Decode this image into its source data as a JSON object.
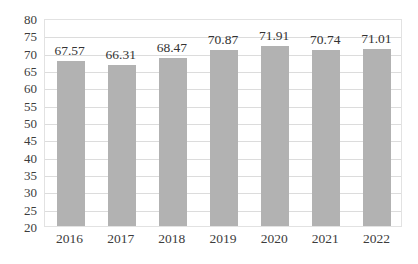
{
  "chart_data": {
    "type": "bar",
    "title": "",
    "subtitle": "",
    "xlabel": "",
    "ylabel": "",
    "categories": [
      "2016",
      "2017",
      "2018",
      "2019",
      "2020",
      "2021",
      "2022"
    ],
    "values": [
      67.57,
      66.31,
      68.47,
      70.87,
      71.91,
      70.74,
      71.01
    ],
    "data_labels": [
      "67.57",
      "66.31",
      "68.47",
      "70.87",
      "71.91",
      "70.74",
      "71.01"
    ],
    "series": [
      {
        "name": "",
        "values": [
          67.57,
          66.31,
          68.47,
          70.87,
          71.91,
          70.74,
          71.01
        ],
        "color": "#B2B2B2"
      }
    ],
    "ylim": [
      20,
      80
    ],
    "ytick_step": 5,
    "ytick_labels": [
      "80",
      "75",
      "70",
      "65",
      "60",
      "55",
      "50",
      "45",
      "40",
      "35",
      "30",
      "25",
      "20"
    ],
    "ytick_values": [
      80,
      75,
      70,
      65,
      60,
      55,
      50,
      45,
      40,
      35,
      30,
      25,
      20
    ],
    "grid": true,
    "grid_axis": "y",
    "legend": false,
    "legend_position": "none",
    "bar_color": "#B2B2B2",
    "gridline_color": "#DCDCDC",
    "plot_border_color": "#E2E2E2",
    "text_color": "#3C3C3C",
    "background": "#FFFFFF"
  }
}
